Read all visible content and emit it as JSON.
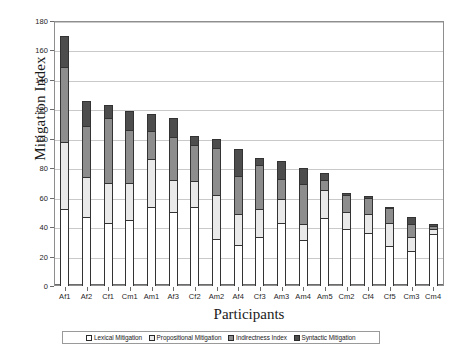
{
  "chart_data": {
    "type": "bar",
    "subtype": "stacked-vertical",
    "title": "",
    "xlabel": "Participants",
    "ylabel": "Mitigation Index",
    "ylim": [
      0,
      180
    ],
    "ytick_step": 20,
    "yticks": [
      0,
      20,
      40,
      60,
      80,
      100,
      120,
      140,
      160,
      180
    ],
    "grid": true,
    "grid_axis": "y",
    "legend_position": "bottom",
    "categories": [
      "Af1",
      "Af2",
      "Cf1",
      "Cm1",
      "Am1",
      "Af3",
      "Cf2",
      "Am2",
      "Af4",
      "Cf3",
      "Am3",
      "Am4",
      "Am5",
      "Cm2",
      "Cf4",
      "Cf5",
      "Cm3",
      "Cm4"
    ],
    "series": [
      {
        "name": "Lexical Mitigation",
        "color": "#ffffff",
        "values": [
          52,
          47,
          43,
          45,
          54,
          50,
          54,
          32,
          28,
          33,
          43,
          31,
          46,
          39,
          36,
          27,
          24,
          35
        ]
      },
      {
        "name": "Propositional Mitigation",
        "color": "#e9e9e9",
        "values": [
          46,
          27,
          27,
          25,
          32,
          22,
          17,
          30,
          21,
          19,
          16,
          11,
          19,
          11,
          13,
          16,
          9,
          4
        ]
      },
      {
        "name": "Indirectness Index",
        "color": "#8d8d8d",
        "values": [
          51,
          35,
          44,
          36,
          19,
          29,
          25,
          32,
          26,
          30,
          14,
          27,
          7,
          12,
          11,
          10,
          9,
          2
        ]
      },
      {
        "name": "Syntactic Mitigation",
        "color": "#4d4d4d",
        "values": [
          21,
          17,
          9,
          13,
          12,
          13,
          6,
          6,
          18,
          5,
          12,
          11,
          5,
          1,
          1,
          1,
          5,
          1
        ]
      }
    ],
    "totals": [
      170,
      126,
      123,
      119,
      117,
      114,
      102,
      100,
      93,
      87,
      85,
      80,
      77,
      63,
      61,
      54,
      47,
      42
    ]
  },
  "legend": {
    "items": [
      {
        "label": "Lexical Mitigation",
        "color": "#ffffff"
      },
      {
        "label": "Propositional Mitigation",
        "color": "#e9e9e9"
      },
      {
        "label": "Indirectness Index",
        "color": "#8d8d8d"
      },
      {
        "label": "Syntactic Mitigation",
        "color": "#4d4d4d"
      }
    ]
  }
}
